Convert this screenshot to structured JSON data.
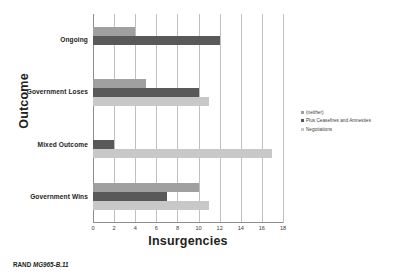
{
  "chart_data": {
    "type": "bar",
    "orientation": "horizontal",
    "title": "",
    "xlabel": "Insurgencies",
    "ylabel": "Outcome",
    "categories": [
      "Ongoing",
      "Government Loses",
      "Mixed Outcome",
      "Government Wins"
    ],
    "series": [
      {
        "name": "(neither)",
        "color": "#a0a0a0",
        "values": [
          4,
          5,
          0,
          10
        ]
      },
      {
        "name": "Plus Ceasefires and Amnesties",
        "color": "#595959",
        "values": [
          12,
          10,
          2,
          7
        ]
      },
      {
        "name": "Negotiations",
        "color": "#c8c8c8",
        "values": [
          0,
          11,
          17,
          11
        ]
      }
    ],
    "xlim": [
      0,
      18
    ],
    "xticks": [
      0,
      2,
      4,
      6,
      8,
      10,
      12,
      14,
      16,
      18
    ],
    "xtick_labels": [
      "0",
      "2",
      "4",
      "6",
      "8",
      "10",
      "12",
      "14",
      "16",
      "18"
    ],
    "grid": "vertical",
    "legend_position": "right"
  },
  "footer": {
    "brand": "RAND",
    "document_id": "MG965-B.11"
  }
}
